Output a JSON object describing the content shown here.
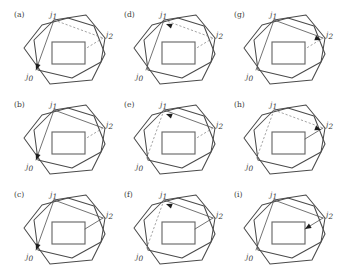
{
  "figure": {
    "name": "polygon-transition-grid",
    "rows": 3,
    "cols": 3,
    "width": 344,
    "height": 276,
    "background": "#ffffff",
    "stroke_color": "#4a4a4a",
    "dash_color": "#8d8d8d",
    "arrow_color": "#1d1d1d",
    "rect_color": "#6a6a6a"
  },
  "labels": {
    "node_base": "j",
    "node_0": "0",
    "node_1": "1",
    "node_2": "2",
    "j0": "j0",
    "j1": "j1",
    "j2": "j2"
  },
  "panels": [
    {
      "tag": "(a)",
      "col": 0,
      "row": 0,
      "arrow_target": "j0",
      "arrow_dir": "down-left",
      "edge_j1_j2": "dashed",
      "edge_j2_rect": "dashed",
      "edge_j1_j0": "solid",
      "shows_j0_label": true,
      "shows_j1_label": true,
      "shows_j2_label": true
    },
    {
      "tag": "(b)",
      "col": 0,
      "row": 1,
      "arrow_target": "j0",
      "arrow_dir": "down-left",
      "edge_j1_j2": "solid",
      "edge_j2_rect": "dashed",
      "edge_j1_j0": "solid",
      "shows_j0_label": true,
      "shows_j1_label": true,
      "shows_j2_label": true
    },
    {
      "tag": "(c)",
      "col": 0,
      "row": 2,
      "arrow_target": "j0",
      "arrow_dir": "down-left",
      "edge_j1_j2": "solid",
      "edge_j2_rect": "solid",
      "edge_j1_j0": "solid",
      "shows_j0_label": true,
      "shows_j1_label": true,
      "shows_j2_label": true
    },
    {
      "tag": "(d)",
      "col": 1,
      "row": 0,
      "arrow_target": "j1",
      "arrow_dir": "up-left",
      "edge_j1_j2": "dashed",
      "edge_j2_rect": "dashed",
      "edge_j1_j0": "solid",
      "shows_j0_label": true,
      "shows_j1_label": true,
      "shows_j2_label": true
    },
    {
      "tag": "(e)",
      "col": 1,
      "row": 1,
      "arrow_target": "j1",
      "arrow_dir": "up-left",
      "edge_j1_j2": "solid",
      "edge_j2_rect": "dashed",
      "edge_j1_j0": "dashed",
      "shows_j0_label": true,
      "shows_j1_label": true,
      "shows_j2_label": true
    },
    {
      "tag": "(f)",
      "col": 1,
      "row": 2,
      "arrow_target": "j1",
      "arrow_dir": "up-left",
      "edge_j1_j2": "solid",
      "edge_j2_rect": "solid",
      "edge_j1_j0": "dashed",
      "shows_j0_label": true,
      "shows_j1_label": true,
      "shows_j2_label": true
    },
    {
      "tag": "(g)",
      "col": 2,
      "row": 0,
      "arrow_target": "j2",
      "arrow_dir": "up-right",
      "edge_j1_j2": "solid",
      "edge_j2_rect": "dashed",
      "edge_j1_j0": "solid",
      "shows_j0_label": true,
      "shows_j1_label": true,
      "shows_j2_label": true
    },
    {
      "tag": "(h)",
      "col": 2,
      "row": 1,
      "arrow_target": "j2",
      "arrow_dir": "up-right",
      "edge_j1_j2": "dashed",
      "edge_j2_rect": "solid",
      "edge_j1_j0": "dashed",
      "shows_j0_label": true,
      "shows_j1_label": true,
      "shows_j2_label": true
    },
    {
      "tag": "(i)",
      "col": 2,
      "row": 2,
      "arrow_target": "rect",
      "arrow_dir": "down-left",
      "edge_j1_j2": "solid",
      "edge_j2_rect": "solid",
      "edge_j1_j0": "solid",
      "shows_j0_label": true,
      "shows_j1_label": true,
      "shows_j2_label": true
    }
  ],
  "geometry": {
    "outer_polygon": "16,44 34,21 60,14 86,22 97,50 84,76 42,80",
    "inner_polygon": "26,36 46,16 78,11 97,34 93,58 64,74 30,66",
    "rect": {
      "x": 44,
      "y": 38,
      "width": 33,
      "height": 22
    },
    "j0": {
      "x": 28,
      "y": 66
    },
    "j1": {
      "x": 46,
      "y": 16
    },
    "j2": {
      "x": 95,
      "y": 34
    },
    "rect_corner": {
      "x": 77,
      "y": 45
    }
  }
}
